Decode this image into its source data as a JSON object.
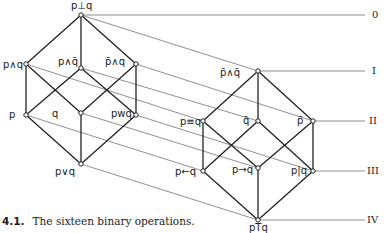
{
  "left_cube": {
    "nodes": [
      {
        "id": "top",
        "label": "p⊥q",
        "x": 81,
        "y": 15
      },
      {
        "id": "pandq",
        "label": "p∧q",
        "x": 26,
        "y": 64
      },
      {
        "id": "pandnq",
        "label": "p∧q̄",
        "x": 81,
        "y": 68
      },
      {
        "id": "npandq",
        "label": "p̄∧q",
        "x": 136,
        "y": 64
      },
      {
        "id": "p",
        "label": "p",
        "x": 26,
        "y": 115
      },
      {
        "id": "q",
        "label": "q",
        "x": 81,
        "y": 113
      },
      {
        "id": "pwq",
        "label": "pwq",
        "x": 136,
        "y": 115
      },
      {
        "id": "porq",
        "label": "p∨q",
        "x": 81,
        "y": 164
      }
    ]
  },
  "right_cube": {
    "nodes": [
      {
        "id": "npandnq",
        "label": "p̄∧q̄",
        "x": 258,
        "y": 71
      },
      {
        "id": "peqq",
        "label": "p≡q",
        "x": 203,
        "y": 121
      },
      {
        "id": "nq",
        "label": "q̄",
        "x": 258,
        "y": 121
      },
      {
        "id": "np",
        "label": "p̄",
        "x": 313,
        "y": 121
      },
      {
        "id": "plarrq",
        "label": "p←q",
        "x": 203,
        "y": 171
      },
      {
        "id": "prarrq",
        "label": "p→q",
        "x": 258,
        "y": 168
      },
      {
        "id": "pnandq",
        "label": "p|q",
        "x": 313,
        "y": 171
      },
      {
        "id": "ptq",
        "label": "pTq",
        "x": 258,
        "y": 220
      }
    ]
  },
  "levels": [
    {
      "label": "0",
      "y": 15
    },
    {
      "label": "I",
      "y": 71
    },
    {
      "label": "II",
      "y": 121
    },
    {
      "label": "III",
      "y": 171
    },
    {
      "label": "IV",
      "y": 220
    }
  ],
  "caption": {
    "number": "4.1.",
    "text": "The sixteen binary operations."
  }
}
